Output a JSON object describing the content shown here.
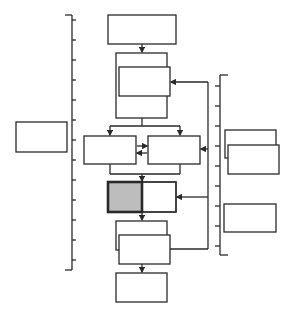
{
  "diagram": {
    "type": "flowchart-with-timelines",
    "stroke_color": "#2a2a2a",
    "shade_color": "#bdbdbd",
    "background": "#ffffff",
    "left_ruler": {
      "x": 72,
      "y_top": 15,
      "y_bottom": 270,
      "ticks": [
        20,
        40,
        60,
        80,
        100,
        120,
        140,
        160,
        180,
        200,
        220,
        240,
        260
      ]
    },
    "right_ruler": {
      "x": 220,
      "y_top": 75,
      "y_bottom": 255,
      "ticks": [
        86,
        106,
        126,
        146,
        166,
        186,
        206,
        226,
        246
      ]
    },
    "boxes": [
      {
        "id": "left-box",
        "x": 16,
        "y": 122,
        "w": 51,
        "h": 30
      },
      {
        "id": "top-box",
        "x": 108,
        "y": 15,
        "w": 68,
        "h": 29
      },
      {
        "id": "stack1-back",
        "x": 116,
        "y": 53,
        "w": 51,
        "h": 65
      },
      {
        "id": "stack1-front",
        "x": 119,
        "y": 67,
        "w": 51,
        "h": 29
      },
      {
        "id": "split-left-box",
        "x": 84,
        "y": 136,
        "w": 52,
        "h": 28
      },
      {
        "id": "split-right-box",
        "x": 148,
        "y": 136,
        "w": 52,
        "h": 28
      },
      {
        "id": "shaded-box",
        "x": 108,
        "y": 182,
        "w": 68,
        "h": 30
      },
      {
        "id": "stack2-back",
        "x": 116,
        "y": 221,
        "w": 51,
        "h": 29
      },
      {
        "id": "stack2-front",
        "x": 119,
        "y": 235,
        "w": 51,
        "h": 29
      },
      {
        "id": "bottom-box",
        "x": 116,
        "y": 273,
        "w": 51,
        "h": 29
      },
      {
        "id": "right-stack-back",
        "x": 225,
        "y": 130,
        "w": 51,
        "h": 28
      },
      {
        "id": "right-stack-front",
        "x": 228,
        "y": 145,
        "w": 51,
        "h": 29
      },
      {
        "id": "right-lower-box",
        "x": 224,
        "y": 204,
        "w": 52,
        "h": 28
      }
    ],
    "labels": []
  }
}
